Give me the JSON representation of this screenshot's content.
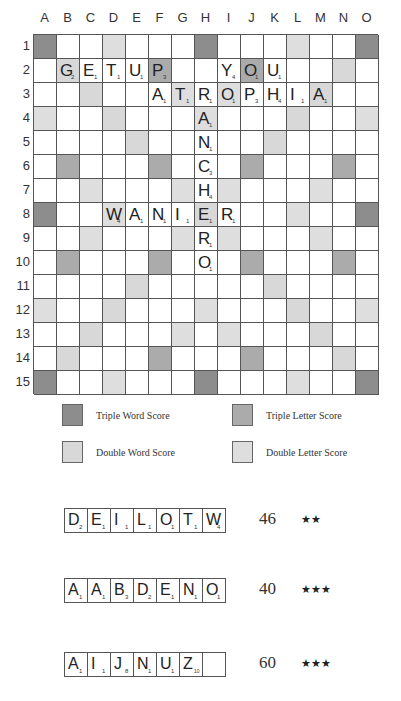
{
  "board": {
    "columns": [
      "A",
      "B",
      "C",
      "D",
      "E",
      "F",
      "G",
      "H",
      "I",
      "J",
      "K",
      "L",
      "M",
      "N",
      "O"
    ],
    "rows": [
      "1",
      "2",
      "3",
      "4",
      "5",
      "6",
      "7",
      "8",
      "9",
      "10",
      "11",
      "12",
      "13",
      "14",
      "15"
    ],
    "premium": {
      "tw": [
        [
          0,
          0
        ],
        [
          0,
          7
        ],
        [
          0,
          14
        ],
        [
          7,
          0
        ],
        [
          7,
          14
        ],
        [
          14,
          0
        ],
        [
          14,
          7
        ],
        [
          14,
          14
        ]
      ],
      "dw": [
        [
          1,
          1
        ],
        [
          2,
          2
        ],
        [
          3,
          3
        ],
        [
          4,
          4
        ],
        [
          1,
          13
        ],
        [
          2,
          12
        ],
        [
          3,
          11
        ],
        [
          4,
          10
        ],
        [
          13,
          1
        ],
        [
          12,
          2
        ],
        [
          11,
          3
        ],
        [
          10,
          4
        ],
        [
          13,
          13
        ],
        [
          12,
          12
        ],
        [
          11,
          11
        ],
        [
          10,
          10
        ],
        [
          7,
          7
        ]
      ],
      "tl": [
        [
          1,
          5
        ],
        [
          1,
          9
        ],
        [
          5,
          1
        ],
        [
          5,
          5
        ],
        [
          5,
          9
        ],
        [
          5,
          13
        ],
        [
          9,
          1
        ],
        [
          9,
          5
        ],
        [
          9,
          9
        ],
        [
          9,
          13
        ],
        [
          13,
          5
        ],
        [
          13,
          9
        ]
      ],
      "dl": [
        [
          0,
          3
        ],
        [
          0,
          11
        ],
        [
          2,
          6
        ],
        [
          2,
          8
        ],
        [
          3,
          0
        ],
        [
          3,
          7
        ],
        [
          3,
          14
        ],
        [
          6,
          2
        ],
        [
          6,
          6
        ],
        [
          6,
          8
        ],
        [
          6,
          12
        ],
        [
          7,
          3
        ],
        [
          7,
          11
        ],
        [
          8,
          2
        ],
        [
          8,
          6
        ],
        [
          8,
          8
        ],
        [
          8,
          12
        ],
        [
          11,
          0
        ],
        [
          11,
          7
        ],
        [
          11,
          14
        ],
        [
          12,
          6
        ],
        [
          12,
          8
        ],
        [
          14,
          3
        ],
        [
          14,
          11
        ]
      ]
    },
    "tiles": [
      {
        "row": 1,
        "col": 1,
        "letter": "G",
        "value": "2"
      },
      {
        "row": 1,
        "col": 2,
        "letter": "E",
        "value": "1"
      },
      {
        "row": 1,
        "col": 3,
        "letter": "T",
        "value": "1"
      },
      {
        "row": 1,
        "col": 4,
        "letter": "U",
        "value": "1"
      },
      {
        "row": 1,
        "col": 5,
        "letter": "P",
        "value": "3"
      },
      {
        "row": 1,
        "col": 8,
        "letter": "Y",
        "value": "4"
      },
      {
        "row": 1,
        "col": 9,
        "letter": "O",
        "value": "1"
      },
      {
        "row": 1,
        "col": 10,
        "letter": "U",
        "value": "1"
      },
      {
        "row": 2,
        "col": 5,
        "letter": "A",
        "value": "1"
      },
      {
        "row": 2,
        "col": 6,
        "letter": "T",
        "value": "1"
      },
      {
        "row": 2,
        "col": 7,
        "letter": "R",
        "value": "1"
      },
      {
        "row": 2,
        "col": 8,
        "letter": "O",
        "value": "1"
      },
      {
        "row": 2,
        "col": 9,
        "letter": "P",
        "value": "3"
      },
      {
        "row": 2,
        "col": 10,
        "letter": "H",
        "value": "4"
      },
      {
        "row": 2,
        "col": 11,
        "letter": "I",
        "value": "1"
      },
      {
        "row": 2,
        "col": 12,
        "letter": "A",
        "value": "1"
      },
      {
        "row": 3,
        "col": 7,
        "letter": "A",
        "value": "1"
      },
      {
        "row": 4,
        "col": 7,
        "letter": "N",
        "value": "1"
      },
      {
        "row": 5,
        "col": 7,
        "letter": "C",
        "value": "3"
      },
      {
        "row": 6,
        "col": 7,
        "letter": "H",
        "value": "4"
      },
      {
        "row": 7,
        "col": 3,
        "letter": "W",
        "value": "4"
      },
      {
        "row": 7,
        "col": 4,
        "letter": "A",
        "value": "1"
      },
      {
        "row": 7,
        "col": 5,
        "letter": "N",
        "value": "1"
      },
      {
        "row": 7,
        "col": 6,
        "letter": "I",
        "value": "1"
      },
      {
        "row": 7,
        "col": 7,
        "letter": "E",
        "value": "1"
      },
      {
        "row": 7,
        "col": 8,
        "letter": "R",
        "value": "1"
      },
      {
        "row": 8,
        "col": 7,
        "letter": "R",
        "value": "1"
      },
      {
        "row": 9,
        "col": 7,
        "letter": "O",
        "value": "1"
      }
    ]
  },
  "legend": {
    "triple_word": "Triple Word Score",
    "triple_letter": "Triple Letter Score",
    "double_word": "Double Word Score",
    "double_letter": "Double Letter Score"
  },
  "colors": {
    "triple_word": "#8d8d8d",
    "triple_letter": "#ababab",
    "double_word": "#d8d8d8",
    "double_letter": "#dedede"
  },
  "racks": [
    {
      "tiles": [
        {
          "letter": "D",
          "value": "2"
        },
        {
          "letter": "E",
          "value": "1"
        },
        {
          "letter": "I",
          "value": "1"
        },
        {
          "letter": "L",
          "value": "1"
        },
        {
          "letter": "O",
          "value": "1"
        },
        {
          "letter": "T",
          "value": "1"
        },
        {
          "letter": "W",
          "value": "4"
        }
      ],
      "score": "46",
      "stars": "★★"
    },
    {
      "tiles": [
        {
          "letter": "A",
          "value": "1"
        },
        {
          "letter": "A",
          "value": "1"
        },
        {
          "letter": "B",
          "value": "3"
        },
        {
          "letter": "D",
          "value": "2"
        },
        {
          "letter": "E",
          "value": "1"
        },
        {
          "letter": "N",
          "value": "1"
        },
        {
          "letter": "O",
          "value": "1"
        }
      ],
      "score": "40",
      "stars": "★★★"
    },
    {
      "tiles": [
        {
          "letter": "A",
          "value": "1"
        },
        {
          "letter": "I",
          "value": "1"
        },
        {
          "letter": "J",
          "value": "8"
        },
        {
          "letter": "N",
          "value": "1"
        },
        {
          "letter": "U",
          "value": "1"
        },
        {
          "letter": "Z",
          "value": "10"
        },
        {
          "letter": "",
          "value": ""
        }
      ],
      "score": "60",
      "stars": "★★★"
    }
  ]
}
